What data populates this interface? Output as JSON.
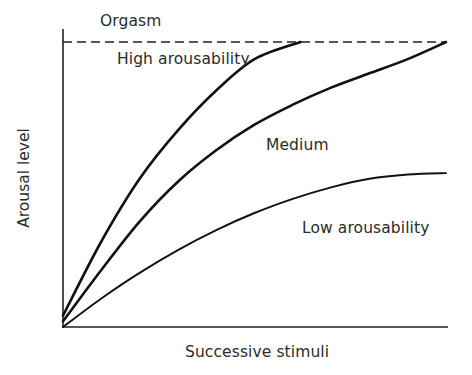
{
  "chart_data": {
    "type": "line",
    "title": "",
    "xlabel": "Successive stimuli",
    "ylabel": "Arousal level",
    "xlim": [
      0,
      10
    ],
    "ylim": [
      0,
      100
    ],
    "grid": false,
    "legend": "none (inline curve labels)",
    "reference_lines": [
      {
        "name": "Orgasm",
        "y": 100,
        "style": "dashed"
      }
    ],
    "series": [
      {
        "name": "High arousability",
        "x": [
          0,
          1,
          2,
          3,
          4,
          5,
          6.2
        ],
        "y": [
          4,
          30,
          52,
          69,
          83,
          94,
          100
        ]
      },
      {
        "name": "Medium",
        "x": [
          0,
          1,
          2,
          3,
          4,
          5,
          6,
          7,
          8,
          9,
          10
        ],
        "y": [
          2,
          20,
          37,
          51,
          62,
          71,
          78,
          84,
          89,
          94,
          100
        ]
      },
      {
        "name": "Low arousability",
        "x": [
          0,
          1,
          2,
          3,
          4,
          5,
          6,
          7,
          8,
          9,
          10
        ],
        "y": [
          0,
          10,
          19,
          27,
          34,
          40,
          45,
          49,
          52,
          53.5,
          54
        ]
      }
    ],
    "annotations": [
      "Orgasm",
      "High arousability",
      "Medium",
      "Low arousability"
    ]
  },
  "labels": {
    "orgasm": "Orgasm",
    "high": "High arousability",
    "medium": "Medium",
    "low": "Low arousability",
    "xlabel": "Successive stimuli",
    "ylabel": "Arousal level"
  }
}
